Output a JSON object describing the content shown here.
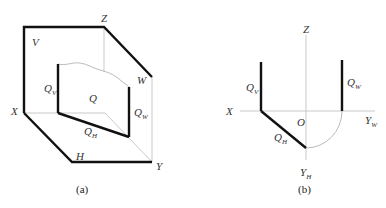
{
  "figure_a": {
    "caption": "(a)",
    "labels": {
      "Z": "Z",
      "V": "V",
      "W": "W",
      "X": "X",
      "Y": "Y",
      "H": "H",
      "Q": "Q",
      "QV_main": "Q",
      "QV_sub": "V",
      "QW_main": "Q",
      "QW_sub": "W",
      "QH_main": "Q",
      "QH_sub": "H"
    }
  },
  "figure_b": {
    "caption": "(b)",
    "labels": {
      "Z": "Z",
      "X": "X",
      "O": "O",
      "YW_main": "Y",
      "YW_sub": "W",
      "YH_main": "Y",
      "YH_sub": "H",
      "QV_main": "Q",
      "QV_sub": "V",
      "QW_main": "Q",
      "QW_sub": "W",
      "QH_main": "Q",
      "QH_sub": "H"
    }
  },
  "colors": {
    "thick": "#111111",
    "thin": "#b8b8b8"
  }
}
